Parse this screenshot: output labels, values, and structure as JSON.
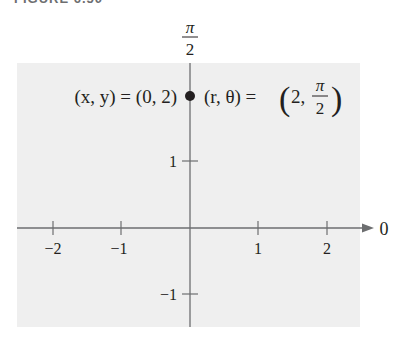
{
  "figure": {
    "caption": "FIGURE 6.50",
    "panel_color": "#efefef",
    "axis_color": "#6d6e70",
    "text_color": "#231f20"
  },
  "diagram": {
    "type": "polar-coordinate-plot",
    "polar_axis_label": "0",
    "vertical_axis_label": {
      "num": "π",
      "den": "2"
    },
    "x_ticks": [
      {
        "value": -2,
        "label": "−2"
      },
      {
        "value": -1,
        "label": "−1"
      },
      {
        "value": 1,
        "label": "1"
      },
      {
        "value": 2,
        "label": "2"
      }
    ],
    "y_ticks": [
      {
        "value": 1,
        "label": "1"
      },
      {
        "value": -1,
        "label": "−1"
      }
    ],
    "point": {
      "x": 0,
      "y": 2,
      "rect_label": "(x, y) = (0, 2)",
      "polar_label_prefix": "(r, θ) = ",
      "polar_r": "2,",
      "polar_theta_num": "π",
      "polar_theta_den": "2"
    }
  }
}
